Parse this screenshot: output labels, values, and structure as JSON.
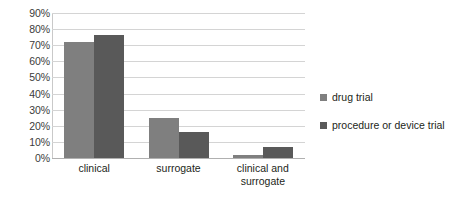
{
  "chart_data": {
    "type": "bar",
    "title": "",
    "subtitle": "",
    "xlabel": "",
    "ylabel": "",
    "categories": [
      "clinical",
      "surrogate",
      "clinical and surrogate"
    ],
    "category_lines": [
      [
        "clinical"
      ],
      [
        "surrogate"
      ],
      [
        "clinical and",
        "surrogate"
      ]
    ],
    "series": [
      {
        "name": "drug trial",
        "color": "#7f7f7f",
        "values": [
          72,
          25,
          2
        ]
      },
      {
        "name": "procedure or device trial",
        "color": "#595959",
        "values": [
          76.5,
          16,
          7
        ]
      }
    ],
    "ylim": [
      0,
      90
    ],
    "ytick_values": [
      0,
      10,
      20,
      30,
      40,
      50,
      60,
      70,
      80,
      90
    ],
    "ytick_labels": [
      "0%",
      "10%",
      "20%",
      "30%",
      "40%",
      "50%",
      "60%",
      "70%",
      "80%",
      "90%"
    ],
    "value_unit": "%",
    "grid": true,
    "grid_axis": "y",
    "legend_position": "right",
    "legend_marker": "square",
    "gridline_color": "#d4d4d4",
    "axis_color": "#b0b0b0",
    "background_color": "#ffffff",
    "text_color": "#231f20"
  }
}
